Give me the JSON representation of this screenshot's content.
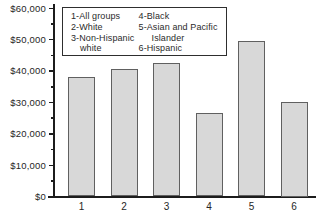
{
  "chart_data": {
    "type": "bar",
    "title": "",
    "xlabel": "",
    "ylabel": "",
    "categories": [
      "1",
      "2",
      "3",
      "4",
      "5",
      "6"
    ],
    "values": [
      38000,
      40500,
      42500,
      26500,
      49500,
      30000
    ],
    "series_note": "Income in dollars per group; values estimated from axis",
    "ylim": [
      0,
      60000
    ],
    "ytick_step": 10000,
    "yminor_step": 5000,
    "ytick_labels": [
      "$0",
      "$10,000",
      "$20,000",
      "$30,000",
      "$40,000",
      "$50,000",
      "$60,000"
    ],
    "grid": false,
    "legend_position": "top-inside",
    "legend_columns": [
      [
        "1-All groups",
        "2-White",
        "3-Non-Hispanic white"
      ],
      [
        "4-Black",
        "5-Asian and Pacific Islander",
        "6-Hispanic"
      ]
    ],
    "colors": {
      "bar_fill": "#d8d8d8",
      "bar_border": "#606060",
      "axis": "#1c1c1c",
      "text": "#262626",
      "legend_border": "#2e2e2e",
      "background": "#ffffff"
    }
  }
}
